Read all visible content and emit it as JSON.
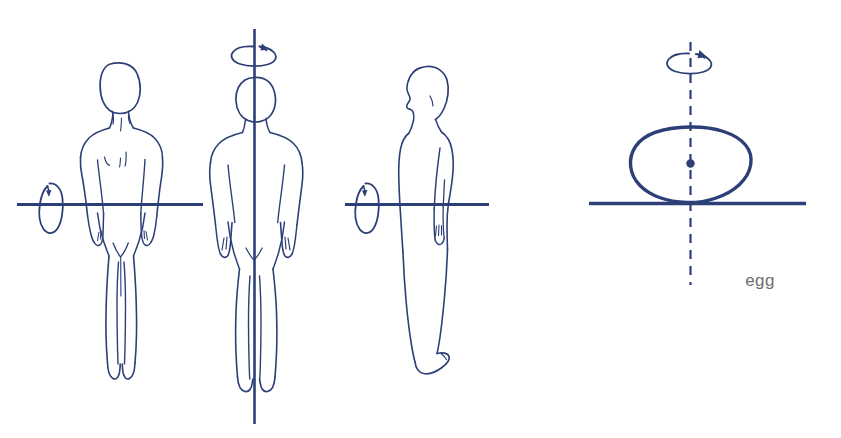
{
  "illustration": {
    "title": "Body rotation axes diagram",
    "background_color": "#ffffff",
    "ink_color": "#2d3f77",
    "label_color": "#6d6d6d",
    "caption": "egg",
    "figures": [
      {
        "id": "figure-1",
        "name": "human-front-view-horizontal-axis",
        "view": "front",
        "axis_type": "horizontal",
        "axis_style": "solid",
        "rotation_indicator": "vertical-loop-arrow-left",
        "label": ""
      },
      {
        "id": "figure-2",
        "name": "human-front-view-vertical-axis",
        "view": "front",
        "axis_type": "vertical",
        "axis_style": "solid",
        "rotation_indicator": "horizontal-loop-arrow-top",
        "label": ""
      },
      {
        "id": "figure-3",
        "name": "human-side-view-horizontal-axis",
        "view": "side-profile",
        "axis_type": "horizontal",
        "axis_style": "solid",
        "rotation_indicator": "vertical-loop-arrow-left",
        "label": ""
      },
      {
        "id": "figure-4",
        "name": "egg-vertical-axis",
        "view": "egg-shape",
        "axis_type": "vertical",
        "axis_style": "dashed",
        "rotation_indicator": "horizontal-loop-arrow-top",
        "label": "egg"
      }
    ]
  }
}
